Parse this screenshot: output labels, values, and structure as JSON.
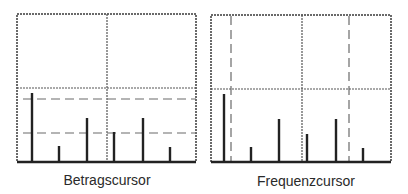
{
  "figure": {
    "colors": {
      "frame": "#3a3a3a",
      "grid": "#555555",
      "spike": "#222222",
      "cursor": "#6a6a6a",
      "background": "#ffffff"
    },
    "panels": [
      {
        "id": "betrag",
        "caption": "Betragscursor",
        "cursor_type": "horizontal",
        "cursors_y": [
          99,
          133
        ],
        "spikes": [
          {
            "x": 32,
            "top": 93
          },
          {
            "x": 59,
            "top": 146
          },
          {
            "x": 87,
            "top": 118
          },
          {
            "x": 114,
            "top": 132
          },
          {
            "x": 143,
            "top": 118
          },
          {
            "x": 170,
            "top": 147
          }
        ]
      },
      {
        "id": "frequenz",
        "caption": "Frequenzcursor",
        "cursor_type": "vertical",
        "cursors_x": [
          231,
          349
        ],
        "spikes": [
          {
            "x": 224,
            "top": 94
          },
          {
            "x": 251,
            "top": 147
          },
          {
            "x": 279,
            "top": 119
          },
          {
            "x": 307,
            "top": 134
          },
          {
            "x": 336,
            "top": 119
          },
          {
            "x": 363,
            "top": 148
          }
        ]
      }
    ]
  }
}
